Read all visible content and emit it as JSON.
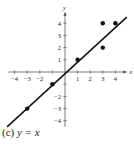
{
  "chart_data": {
    "type": "scatter",
    "title": "",
    "caption_label": "(c)",
    "caption_equation": "y = x",
    "xlabel": "x",
    "ylabel": "y",
    "xlim": [
      -4.5,
      4.7
    ],
    "ylim": [
      -4.5,
      4.7
    ],
    "x_ticks": [
      -4,
      -3,
      -2,
      -1,
      1,
      2,
      3,
      4
    ],
    "x_tick_labels": [
      "−4",
      "−3",
      "−2",
      "",
      "1",
      "2",
      "3",
      "4"
    ],
    "y_ticks": [
      -4,
      -3,
      -2,
      -1,
      1,
      2,
      3,
      4
    ],
    "y_tick_labels": [
      "−4",
      "−3",
      "−2",
      "",
      "1",
      "2",
      "3",
      "4"
    ],
    "grid": false,
    "series": [
      {
        "name": "points",
        "type": "scatter",
        "points": [
          [
            -3,
            -3
          ],
          [
            -1,
            -1
          ],
          [
            1,
            1
          ],
          [
            3,
            4
          ],
          [
            3,
            2
          ],
          [
            4,
            4
          ]
        ]
      },
      {
        "name": "y = x",
        "type": "line",
        "points": [
          [
            -4.6,
            -4.5
          ],
          [
            4.9,
            4.5
          ]
        ]
      }
    ],
    "colors": {
      "line": "#111111",
      "points": "#111111",
      "axes": "#444444"
    }
  }
}
